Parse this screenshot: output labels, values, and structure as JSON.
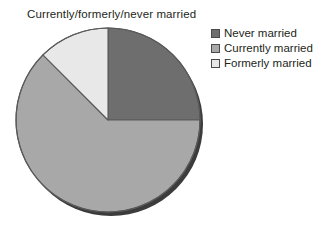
{
  "title": "Currently/formerly/never married",
  "legend": {
    "items": [
      {
        "label": "Never married",
        "color": "#6e6e6e",
        "swatch_name": "legend-swatch-never-married"
      },
      {
        "label": "Currently married",
        "color": "#a8a8a8",
        "swatch_name": "legend-swatch-currently-married"
      },
      {
        "label": "Formerly married",
        "color": "#e8e8e8",
        "swatch_name": "legend-swatch-formerly-married"
      }
    ]
  },
  "chart_data": {
    "type": "pie",
    "title": "Currently/formerly/never married",
    "xlabel": "",
    "ylabel": "",
    "legend_position": "top-right",
    "grid": false,
    "start_angle_deg": 0,
    "direction": "clockwise",
    "categories": [
      "Never married",
      "Currently married",
      "Formerly married"
    ],
    "values": [
      25,
      62.5,
      12.5
    ],
    "value_unit": "percent",
    "colors": [
      "#6e6e6e",
      "#a8a8a8",
      "#e8e8e8"
    ],
    "slices": [
      {
        "label": "Never married",
        "value": 25,
        "color": "#6e6e6e",
        "start_deg": 0,
        "end_deg": 90
      },
      {
        "label": "Currently married",
        "value": 62.5,
        "color": "#a8a8a8",
        "start_deg": 90,
        "end_deg": 315
      },
      {
        "label": "Formerly married",
        "value": 12.5,
        "color": "#e8e8e8",
        "start_deg": 315,
        "end_deg": 360
      }
    ],
    "style": {
      "has_3d_shadow": true,
      "shadow_color": "#3c3c3c",
      "outline_color": "#5a5a5a",
      "center_x": 96,
      "center_y": 96,
      "radius": 92
    }
  }
}
